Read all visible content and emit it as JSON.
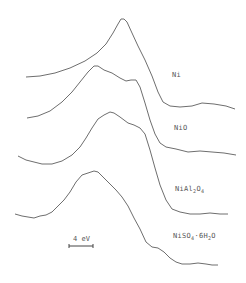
{
  "chart_data": {
    "type": "line",
    "title": "",
    "xlabel": "",
    "ylabel": "",
    "grid": false,
    "axes_visible": false,
    "layout": "vertically offset stacked spectra",
    "scale_bar": {
      "label": "4 eV",
      "x1": 69,
      "x2": 93,
      "y": 246
    },
    "series": [
      {
        "name": "Ni",
        "label_parts": [
          "Ni"
        ],
        "label_pos": [
          172,
          71
        ],
        "points": [
          [
            26,
            77
          ],
          [
            40,
            76
          ],
          [
            55,
            73
          ],
          [
            70,
            68
          ],
          [
            85,
            61
          ],
          [
            97,
            53
          ],
          [
            106,
            44
          ],
          [
            113,
            33
          ],
          [
            118,
            24
          ],
          [
            121,
            19
          ],
          [
            124,
            19
          ],
          [
            127,
            22
          ],
          [
            132,
            33
          ],
          [
            138,
            46
          ],
          [
            145,
            60
          ],
          [
            152,
            76
          ],
          [
            158,
            92
          ],
          [
            163,
            102
          ],
          [
            170,
            106
          ],
          [
            180,
            107
          ],
          [
            192,
            106
          ],
          [
            202,
            103
          ],
          [
            214,
            104
          ],
          [
            226,
            106
          ],
          [
            235,
            109
          ]
        ]
      },
      {
        "name": "NiO",
        "label_parts": [
          "NiO"
        ],
        "label_pos": [
          174,
          124
        ],
        "points": [
          [
            27,
            118
          ],
          [
            38,
            116
          ],
          [
            50,
            111
          ],
          [
            62,
            102
          ],
          [
            72,
            92
          ],
          [
            80,
            82
          ],
          [
            88,
            72
          ],
          [
            94,
            66
          ],
          [
            98,
            66
          ],
          [
            104,
            70
          ],
          [
            112,
            73
          ],
          [
            120,
            78
          ],
          [
            126,
            81
          ],
          [
            131,
            80
          ],
          [
            136,
            80
          ],
          [
            140,
            87
          ],
          [
            145,
            103
          ],
          [
            150,
            120
          ],
          [
            155,
            134
          ],
          [
            160,
            143
          ],
          [
            166,
            147
          ],
          [
            176,
            149
          ],
          [
            188,
            152
          ],
          [
            200,
            151
          ],
          [
            212,
            152
          ],
          [
            224,
            153
          ],
          [
            236,
            155
          ]
        ]
      },
      {
        "name": "NiAl2O4",
        "label_parts": [
          "NiAl",
          "2",
          "O",
          "4"
        ],
        "label_pos": [
          175,
          185
        ],
        "points": [
          [
            18,
            156
          ],
          [
            26,
            160
          ],
          [
            34,
            162
          ],
          [
            42,
            164
          ],
          [
            52,
            164
          ],
          [
            62,
            161
          ],
          [
            72,
            155
          ],
          [
            80,
            147
          ],
          [
            86,
            138
          ],
          [
            92,
            128
          ],
          [
            98,
            119
          ],
          [
            104,
            115
          ],
          [
            110,
            112
          ],
          [
            114,
            113
          ],
          [
            120,
            117
          ],
          [
            128,
            123
          ],
          [
            134,
            125
          ],
          [
            140,
            128
          ],
          [
            145,
            134
          ],
          [
            150,
            150
          ],
          [
            155,
            168
          ],
          [
            160,
            185
          ],
          [
            166,
            200
          ],
          [
            172,
            209
          ],
          [
            180,
            212
          ],
          [
            190,
            214
          ],
          [
            200,
            214
          ],
          [
            210,
            213
          ],
          [
            220,
            214
          ],
          [
            228,
            214
          ]
        ]
      },
      {
        "name": "NiSO4·6H2O",
        "label_parts": [
          "NiSO",
          "4",
          "·6H",
          "2",
          "O"
        ],
        "label_pos": [
          173,
          232
        ],
        "points": [
          [
            15,
            214
          ],
          [
            22,
            216
          ],
          [
            28,
            217
          ],
          [
            34,
            218
          ],
          [
            40,
            216
          ],
          [
            46,
            215
          ],
          [
            52,
            212
          ],
          [
            58,
            206
          ],
          [
            64,
            200
          ],
          [
            70,
            192
          ],
          [
            76,
            182
          ],
          [
            82,
            175
          ],
          [
            88,
            173
          ],
          [
            94,
            171
          ],
          [
            98,
            172
          ],
          [
            104,
            178
          ],
          [
            110,
            184
          ],
          [
            116,
            190
          ],
          [
            122,
            197
          ],
          [
            128,
            206
          ],
          [
            134,
            218
          ],
          [
            140,
            229
          ],
          [
            146,
            242
          ],
          [
            152,
            247
          ],
          [
            158,
            248
          ],
          [
            164,
            252
          ],
          [
            170,
            258
          ],
          [
            176,
            262
          ],
          [
            182,
            264
          ],
          [
            190,
            264
          ],
          [
            198,
            263
          ],
          [
            206,
            264
          ],
          [
            212,
            265
          ],
          [
            218,
            265
          ]
        ]
      }
    ]
  },
  "style": {
    "line_color": "#6e6e6e",
    "text_color": "#555555",
    "background": "#ffffff"
  }
}
